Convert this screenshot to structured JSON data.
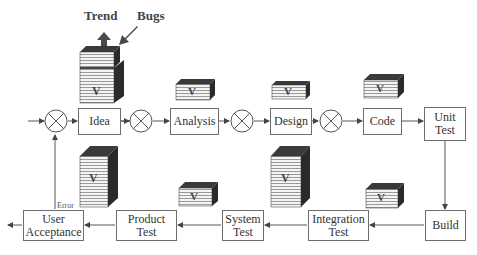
{
  "diagram": {
    "type": "process-flow",
    "top_row": [
      {
        "id": "idea",
        "label": "Idea"
      },
      {
        "id": "analysis",
        "label": "Analysis"
      },
      {
        "id": "design",
        "label": "Design"
      },
      {
        "id": "code",
        "label": "Code"
      },
      {
        "id": "unit_test",
        "label": "Unit\nTest"
      }
    ],
    "bottom_row": [
      {
        "id": "build",
        "label": "Build"
      },
      {
        "id": "integration_test",
        "label": "Integration\nTest"
      },
      {
        "id": "system_test",
        "label": "System\nTest"
      },
      {
        "id": "product_test",
        "label": "Product\nTest"
      },
      {
        "id": "user_acceptance",
        "label": "User\nAcceptance"
      }
    ],
    "annotations": {
      "trend": "Trend",
      "bugs": "Bugs",
      "error": "Error"
    },
    "block_label": "V",
    "summing_junctions": 4,
    "colors": {
      "line": "#555555",
      "block_dark": "#2a2a2a",
      "block_stripe": "#9a9a9a",
      "arrow_fill": "#4a4a4a"
    }
  }
}
